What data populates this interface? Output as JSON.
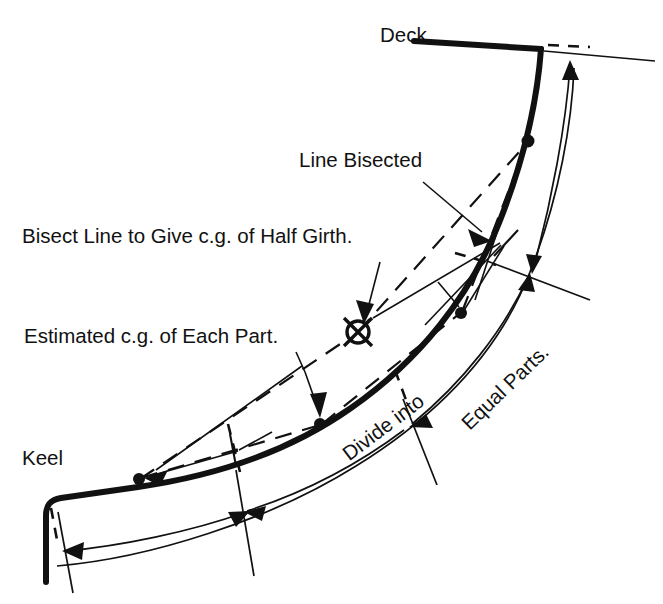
{
  "diagram": {
    "background_color": "#ffffff",
    "ink_color": "#111111"
  },
  "labels": {
    "deck": "Deck",
    "keel": "Keel",
    "line_bisected": "Line Bisected",
    "bisect_line": "Bisect Line to Give c.g. of Half Girth.",
    "estimated_cg": "Estimated c.g. of Each Part.",
    "divide_into": "Divide into",
    "equal_parts": "Equal Parts."
  },
  "markers": {
    "half_girth_cg": {
      "name": "crossed-circle-cg-marker",
      "cx": 358,
      "cy": 332,
      "r": 11
    },
    "part_cg_dots": [
      {
        "cx": 139,
        "cy": 479
      },
      {
        "cx": 320,
        "cy": 424
      },
      {
        "cx": 461,
        "cy": 313
      },
      {
        "cx": 528,
        "cy": 141
      }
    ],
    "bisection_point": {
      "cx": 507,
      "cy": 243
    }
  },
  "geometry": {
    "hull_path": "M 46,580 L 46,514 Q 47,502 60,500 L 200,479 Q 320,457 400,400 Q 480,344 516,240 Q 540,165 547,92 L 547,46 L 414,40",
    "outer_arc": "M 56,563 Q 250,543 400,462 Q 520,396 560,270 Q 586,180 591,74",
    "divider_ticks": [
      {
        "x1": 68,
        "y1": 500,
        "x2": 83,
        "y2": 588
      },
      {
        "x1": 246,
        "y1": 462,
        "x2": 262,
        "y2": 553
      },
      {
        "x1": 411,
        "y1": 398,
        "x2": 455,
        "y2": 474
      },
      {
        "x1": 495,
        "y1": 268,
        "x2": 578,
        "y2": 312
      },
      {
        "x1": 541,
        "y1": 52,
        "x2": 652,
        "y2": 63
      }
    ]
  }
}
